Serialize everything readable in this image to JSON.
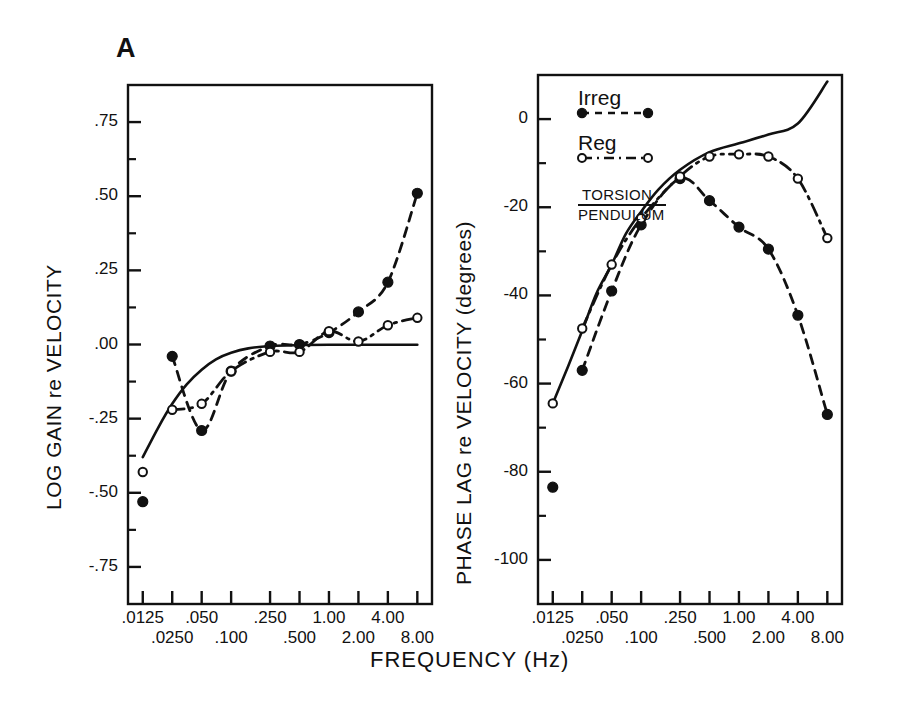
{
  "figure": {
    "panel_letter": "A",
    "xaxis_title": "FREQUENCY (Hz)"
  },
  "legend": {
    "irreg_label": "Irreg",
    "reg_label": "Reg",
    "model_numerator": "TORSION",
    "model_denominator": "PENDULUM"
  },
  "colors": {
    "ink": "#111111",
    "frame": "#111111",
    "background": "#ffffff"
  },
  "chart_data": [
    {
      "type": "scatter",
      "panel": "left",
      "title": "A",
      "xlabel": "FREQUENCY (Hz)",
      "ylabel": "LOG GAIN re VELOCITY",
      "xscale": "log",
      "xlim": [
        0.00883,
        11.3
      ],
      "ylim": [
        -0.875,
        0.875
      ],
      "grid": false,
      "xticks": [
        0.0125,
        0.025,
        0.05,
        0.1,
        0.25,
        0.5,
        1.0,
        2.0,
        4.0,
        8.0
      ],
      "xticklabels": [
        ".0125",
        ".0250",
        ".050",
        ".100",
        ".250",
        ".500",
        "1.00",
        "2.00",
        "4.00",
        "8.00"
      ],
      "yticks": [
        0.75,
        0.5,
        0.25,
        0.0,
        -0.25,
        -0.5,
        -0.75
      ],
      "yticklabels": [
        ".75",
        ".50",
        ".25",
        ".00",
        "-.25",
        "-.50",
        "-.75"
      ],
      "yminorticks": [
        0.625,
        0.375,
        0.125,
        -0.125,
        -0.375,
        -0.625
      ],
      "series": [
        {
          "name": "Irreg",
          "marker": "filled-circle",
          "line": "dashed",
          "x": [
            0.0125,
            0.025,
            0.05,
            0.1,
            0.25,
            0.5,
            1.0,
            2.0,
            4.0,
            8.0
          ],
          "y": [
            -0.53,
            -0.04,
            -0.29,
            -0.09,
            -0.005,
            0.0,
            0.04,
            0.11,
            0.21,
            0.51
          ]
        },
        {
          "name": "Reg",
          "marker": "open-circle",
          "line": "dash-dot",
          "x": [
            0.0125,
            0.025,
            0.05,
            0.1,
            0.25,
            0.5,
            1.0,
            2.0,
            4.0,
            8.0
          ],
          "y": [
            -0.43,
            -0.22,
            -0.2,
            -0.09,
            -0.025,
            -0.025,
            0.045,
            0.01,
            0.065,
            0.09
          ]
        },
        {
          "name": "TORSION PENDULUM",
          "marker": "none",
          "line": "solid",
          "x": [
            0.0125,
            0.018,
            0.025,
            0.035,
            0.05,
            0.07,
            0.1,
            0.15,
            0.25,
            0.5,
            1.0,
            2.0,
            4.0,
            8.0
          ],
          "y": [
            -0.38,
            -0.28,
            -0.2,
            -0.135,
            -0.085,
            -0.05,
            -0.028,
            -0.013,
            -0.005,
            -0.002,
            -0.001,
            -0.001,
            -0.001,
            -0.001
          ]
        }
      ]
    },
    {
      "type": "scatter",
      "panel": "right",
      "xlabel": "FREQUENCY (Hz)",
      "ylabel": "PHASE LAG re VELOCITY (degrees)",
      "xscale": "log",
      "xlim": [
        0.00883,
        11.3
      ],
      "ylim": [
        -110,
        10
      ],
      "grid": false,
      "xticks": [
        0.0125,
        0.025,
        0.05,
        0.1,
        0.25,
        0.5,
        1.0,
        2.0,
        4.0,
        8.0
      ],
      "xticklabels": [
        ".0125",
        ".0250",
        ".050",
        ".100",
        ".250",
        ".500",
        "1.00",
        "2.00",
        "4.00",
        "8.00"
      ],
      "yticks": [
        -100,
        -80,
        -60,
        -40,
        -20,
        0
      ],
      "yticklabels": [
        "-100",
        "-80",
        "-60",
        "-40",
        "-20",
        "0"
      ],
      "yminorticks": [
        -90,
        -70,
        -50,
        -30,
        -10
      ],
      "series": [
        {
          "name": "Irreg",
          "marker": "filled-circle",
          "line": "dashed",
          "x": [
            0.0125,
            0.025,
            0.05,
            0.1,
            0.25,
            0.5,
            1.0,
            2.0,
            4.0,
            8.0
          ],
          "y": [
            -83.5,
            -57.0,
            -39.0,
            -24.0,
            -13.5,
            -18.5,
            -24.5,
            -29.5,
            -44.5,
            -67.0
          ]
        },
        {
          "name": "Reg",
          "marker": "open-circle",
          "line": "dash-dot",
          "x": [
            0.0125,
            0.025,
            0.05,
            0.1,
            0.25,
            0.5,
            1.0,
            2.0,
            4.0,
            8.0
          ],
          "y": [
            -64.5,
            -47.5,
            -33.0,
            -22.5,
            -13.0,
            -8.5,
            -8.0,
            -8.5,
            -13.5,
            -27.0
          ]
        },
        {
          "name": "TORSION PENDULUM",
          "marker": "none",
          "line": "solid",
          "x": [
            0.0125,
            0.018,
            0.025,
            0.035,
            0.05,
            0.07,
            0.1,
            0.15,
            0.25,
            0.5,
            1.0,
            2.0,
            4.0,
            8.0
          ],
          "y": [
            -64.5,
            -56.0,
            -48.0,
            -39.5,
            -33.0,
            -26.0,
            -21.0,
            -16.0,
            -11.5,
            -7.5,
            -5.5,
            -3.5,
            -1.0,
            8.5
          ]
        }
      ]
    }
  ]
}
